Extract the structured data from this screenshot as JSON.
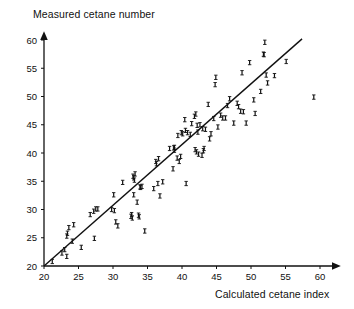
{
  "chart_data": {
    "type": "scatter",
    "title": "",
    "xlabel": "Calculated cetane index",
    "ylabel": "Measured cetane number",
    "xlim": [
      20,
      62
    ],
    "ylim": [
      20,
      61
    ],
    "xticks": [
      20,
      25,
      30,
      35,
      40,
      45,
      50,
      55,
      60
    ],
    "yticks": [
      20,
      25,
      30,
      35,
      40,
      45,
      50,
      55,
      60
    ],
    "grid": false,
    "legend": null,
    "marker": "i-bar",
    "marker_color": "#111111",
    "line_color": "#111111",
    "axis_color": "#111111",
    "fit_line": {
      "label": "identity / regression line",
      "x_start": 20.0,
      "y_start": 20.0,
      "x_end": 57.4,
      "y_end": 60.2
    },
    "points": [
      [
        21.2,
        20.8
      ],
      [
        22.6,
        22.3
      ],
      [
        23.0,
        22.9
      ],
      [
        23.3,
        21.7
      ],
      [
        23.3,
        25.3
      ],
      [
        23.4,
        25.8
      ],
      [
        23.6,
        26.8
      ],
      [
        24.1,
        24.4
      ],
      [
        24.3,
        27.3
      ],
      [
        25.4,
        23.3
      ],
      [
        26.7,
        29.1
      ],
      [
        27.2,
        29.7
      ],
      [
        27.3,
        24.9
      ],
      [
        27.5,
        30.1
      ],
      [
        27.8,
        30.1
      ],
      [
        29.8,
        30.0
      ],
      [
        30.1,
        32.6
      ],
      [
        30.2,
        29.8
      ],
      [
        30.4,
        27.8
      ],
      [
        30.7,
        27.1
      ],
      [
        31.4,
        34.8
      ],
      [
        32.6,
        28.8
      ],
      [
        32.7,
        29.1
      ],
      [
        32.8,
        28.5
      ],
      [
        32.9,
        35.9
      ],
      [
        33.0,
        32.6
      ],
      [
        33.0,
        35.6
      ],
      [
        33.1,
        35.2
      ],
      [
        33.2,
        36.3
      ],
      [
        33.5,
        31.3
      ],
      [
        33.7,
        29.0
      ],
      [
        33.8,
        28.7
      ],
      [
        33.9,
        34.0
      ],
      [
        34.0,
        33.9
      ],
      [
        34.2,
        34.1
      ],
      [
        34.6,
        26.2
      ],
      [
        35.9,
        33.7
      ],
      [
        36.2,
        38.5
      ],
      [
        36.3,
        38.1
      ],
      [
        36.5,
        34.6
      ],
      [
        36.6,
        39.0
      ],
      [
        36.8,
        32.4
      ],
      [
        37.2,
        34.9
      ],
      [
        38.2,
        40.8
      ],
      [
        38.7,
        37.2
      ],
      [
        38.8,
        40.9
      ],
      [
        38.9,
        40.5
      ],
      [
        38.9,
        41.0
      ],
      [
        39.3,
        39.1
      ],
      [
        39.4,
        43.1
      ],
      [
        39.6,
        38.5
      ],
      [
        39.8,
        39.4
      ],
      [
        39.9,
        43.6
      ],
      [
        40.1,
        43.4
      ],
      [
        40.4,
        45.9
      ],
      [
        40.5,
        44.0
      ],
      [
        40.6,
        34.6
      ],
      [
        40.8,
        43.6
      ],
      [
        41.2,
        43.3
      ],
      [
        41.4,
        45.2
      ],
      [
        41.8,
        46.5
      ],
      [
        41.9,
        40.6
      ],
      [
        42.0,
        46.9
      ],
      [
        42.1,
        40.2
      ],
      [
        42.2,
        44.9
      ],
      [
        42.3,
        43.7
      ],
      [
        42.4,
        39.8
      ],
      [
        42.6,
        45.0
      ],
      [
        42.9,
        39.6
      ],
      [
        43.0,
        44.3
      ],
      [
        43.1,
        40.4
      ],
      [
        43.2,
        40.8
      ],
      [
        43.4,
        44.2
      ],
      [
        43.8,
        48.6
      ],
      [
        44.0,
        42.5
      ],
      [
        44.2,
        43.4
      ],
      [
        44.6,
        46.1
      ],
      [
        44.8,
        52.1
      ],
      [
        44.9,
        53.4
      ],
      [
        45.2,
        44.6
      ],
      [
        45.6,
        46.7
      ],
      [
        45.9,
        46.2
      ],
      [
        46.3,
        46.2
      ],
      [
        46.6,
        48.4
      ],
      [
        46.9,
        49.6
      ],
      [
        47.5,
        45.3
      ],
      [
        48.0,
        48.8
      ],
      [
        48.2,
        48.2
      ],
      [
        48.5,
        47.4
      ],
      [
        48.7,
        54.2
      ],
      [
        48.9,
        47.3
      ],
      [
        49.3,
        45.3
      ],
      [
        49.8,
        56.0
      ],
      [
        50.4,
        49.4
      ],
      [
        50.6,
        47.0
      ],
      [
        51.4,
        50.9
      ],
      [
        51.8,
        57.5
      ],
      [
        51.9,
        57.4
      ],
      [
        52.0,
        59.6
      ],
      [
        52.2,
        53.8
      ],
      [
        52.4,
        52.4
      ],
      [
        53.4,
        53.7
      ],
      [
        55.1,
        56.2
      ],
      [
        59.1,
        49.9
      ]
    ]
  }
}
